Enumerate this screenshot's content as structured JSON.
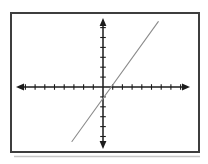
{
  "chart_data": {
    "type": "line",
    "title": "",
    "xlabel": "",
    "ylabel": "",
    "x_range": [
      -9,
      9
    ],
    "y_range": [
      -7,
      7.5
    ],
    "tick_interval": 1,
    "tick_labels_shown": false,
    "grid": false,
    "legend": false,
    "axes_style": "centered-cross-with-arrowheads",
    "series": [
      {
        "name": "line-1",
        "points_x": [
          -3.2,
          5.7
        ],
        "points_y": [
          -5.5,
          6.6
        ],
        "slope": 1.36,
        "x_intercept": 0.8,
        "y_intercept": -1.1,
        "color": "#8c8c8c",
        "width": 1.1
      }
    ]
  },
  "render": {
    "canvas": {
      "width": 208,
      "height": 164,
      "background": "#ffffff"
    },
    "frame": {
      "x": 11,
      "y": 13,
      "width": 188,
      "height": 139,
      "border_color": "#3e3e3e",
      "border_width": 2,
      "shadow_color": "#c6c6c6"
    },
    "origin": {
      "x": 103,
      "y": 87
    },
    "axis": {
      "color": "#1c1c1c",
      "width": 1.5,
      "tick_width": 1.1,
      "arrow_len": 8,
      "arrow_halfwidth": 3.4
    },
    "x_axis": {
      "tip_left": 16,
      "tip_right": 190,
      "ticks_neg": 8,
      "ticks_pos": 8,
      "tick_spacing": 9.7,
      "tick_half": 2.8
    },
    "y_axis": {
      "tip_top": 18,
      "tip_bottom": 149,
      "ticks_up": 6,
      "ticks_down": 5,
      "tick_spacing": 9.9,
      "tick_half": 2.8
    }
  }
}
